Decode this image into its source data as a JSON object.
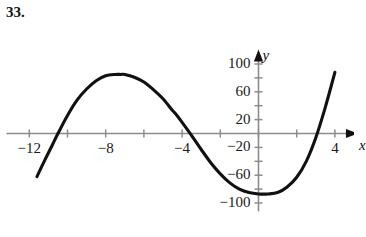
{
  "problem": {
    "number": "33."
  },
  "axes": {
    "x_label": "x",
    "y_label": "y",
    "x_ticks": [
      {
        "value": -12,
        "label": "−12"
      },
      {
        "value": -8,
        "label": "−8"
      },
      {
        "value": -4,
        "label": "−4"
      },
      {
        "value": 4,
        "label": "4"
      }
    ],
    "y_ticks": [
      {
        "value": 100,
        "label": "100"
      },
      {
        "value": 60,
        "label": "60"
      },
      {
        "value": 20,
        "label": "20"
      },
      {
        "value": -20,
        "label": "−20"
      },
      {
        "value": -60,
        "label": "−60"
      },
      {
        "value": -100,
        "label": "−100"
      }
    ],
    "x_minor_ticks": [
      -12,
      -10,
      -8,
      -6,
      -4,
      -2,
      0,
      2,
      4
    ],
    "y_minor_ticks": [
      100,
      80,
      60,
      40,
      20,
      -20,
      -40,
      -60,
      -80,
      -100
    ],
    "x_range": [
      -13.2,
      5.1
    ],
    "y_range": [
      -112,
      118
    ],
    "axis_color": "#8c8c8c",
    "curve_color": "#111111",
    "grid": false,
    "arrow_x": true,
    "arrow_y": true
  },
  "chart_data": {
    "type": "line",
    "title": "",
    "xlabel": "x",
    "ylabel": "y",
    "xlim": [
      -13.2,
      5.1
    ],
    "ylim": [
      -112,
      118
    ],
    "grid": false,
    "legend": "none",
    "features": {
      "local_maximum": {
        "x": -7.2,
        "y": 85
      },
      "local_minimum": {
        "x": 1.0,
        "y": -85
      },
      "x_intercepts": [
        -10.5,
        -4.3,
        3.0
      ],
      "left_endpoint": {
        "x": -11.6,
        "y": -62
      },
      "right_endpoint": {
        "x": 4.0,
        "y": 88
      }
    },
    "x": [
      -11.6,
      -11.2,
      -10.8,
      -10.5,
      -10.0,
      -9.5,
      -9.0,
      -8.5,
      -8.0,
      -7.5,
      -7.2,
      -7.0,
      -6.5,
      -6.0,
      -5.5,
      -5.0,
      -4.5,
      -4.3,
      -4.0,
      -3.5,
      -3.0,
      -2.5,
      -2.0,
      -1.5,
      -1.0,
      -0.5,
      0.0,
      0.5,
      1.0,
      1.5,
      2.0,
      2.5,
      3.0,
      3.5,
      4.0
    ],
    "y": [
      -62,
      -39,
      -17,
      0,
      26,
      48,
      64,
      76,
      83,
      85,
      85,
      85,
      81,
      74,
      63,
      50,
      33,
      27,
      16,
      -3,
      -23,
      -42,
      -58,
      -71,
      -80,
      -85,
      -87,
      -87,
      -85,
      -77,
      -63,
      -40,
      -6,
      38,
      88
    ]
  }
}
